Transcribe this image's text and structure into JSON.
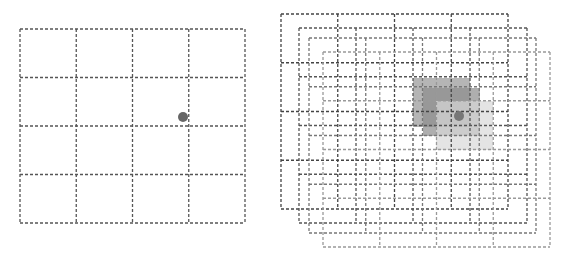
{
  "diagram": {
    "left_panel": {
      "grid": {
        "x": 20,
        "y": 29,
        "width": 225,
        "height": 194,
        "rows": 4,
        "cols": 4,
        "stroke": "#555555"
      },
      "point": {
        "cx": 183,
        "cy": 117,
        "r": 5,
        "color": "#666666"
      }
    },
    "right_panel": {
      "grids": [
        {
          "x": 281,
          "y": 14,
          "width": 227,
          "height": 195,
          "rows": 4,
          "cols": 4,
          "stroke": "#444444"
        },
        {
          "x": 299,
          "y": 28,
          "width": 228,
          "height": 195,
          "rows": 4,
          "cols": 4,
          "stroke": "#555555"
        },
        {
          "x": 309,
          "y": 38,
          "width": 227,
          "height": 195,
          "rows": 4,
          "cols": 4,
          "stroke": "#777777"
        },
        {
          "x": 323,
          "y": 52,
          "width": 227,
          "height": 195,
          "rows": 4,
          "cols": 4,
          "stroke": "#999999"
        }
      ],
      "highlighted_cells": [
        {
          "x": 413,
          "y": 78,
          "width": 57,
          "height": 49,
          "color": "#a8a8a8",
          "opacity": 0.85
        },
        {
          "x": 423,
          "y": 88,
          "width": 57,
          "height": 48,
          "color": "#8c8c8c",
          "opacity": 0.7
        },
        {
          "x": 436,
          "y": 101,
          "width": 57,
          "height": 49,
          "color": "#d8d8d8",
          "opacity": 0.7
        }
      ],
      "point": {
        "cx": 459,
        "cy": 116,
        "r": 5,
        "color": "#777777"
      }
    }
  }
}
